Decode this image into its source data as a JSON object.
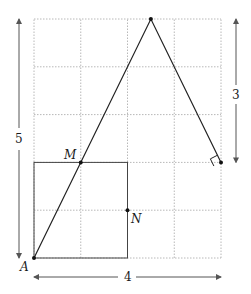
{
  "diagram": {
    "type": "geometry",
    "grid": {
      "cols": 4,
      "rows": 5,
      "style": "dotted",
      "color": "#b8b8b8"
    },
    "points": [
      {
        "name": "A",
        "label": "A",
        "coord": [
          0,
          0
        ]
      },
      {
        "name": "M",
        "label": "M",
        "coord": [
          1,
          2
        ]
      },
      {
        "name": "N",
        "label": "N",
        "coord": [
          2,
          1
        ]
      },
      {
        "name": "T",
        "label": "",
        "coord": [
          2.5,
          5
        ]
      },
      {
        "name": "R",
        "label": "",
        "coord": [
          4,
          2
        ]
      }
    ],
    "square": {
      "from": [
        0,
        0
      ],
      "to": [
        2,
        2
      ]
    },
    "triangle": [
      "A",
      "T",
      "R"
    ],
    "right_angle_at": "R",
    "dimensions": {
      "height": {
        "label": "5",
        "span": [
          0,
          5
        ]
      },
      "width": {
        "label": "4",
        "span": [
          0,
          4
        ]
      },
      "right": {
        "label": "3",
        "span": [
          2,
          5
        ]
      }
    },
    "line_color": "#222222",
    "arrow_color": "#555555"
  }
}
